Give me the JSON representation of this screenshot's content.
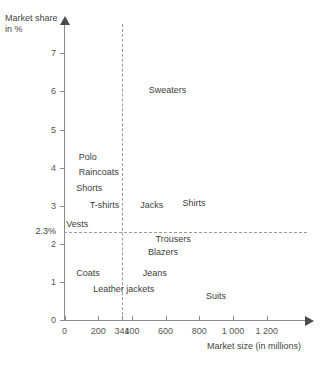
{
  "chart_data": {
    "type": "scatter",
    "title": "",
    "subtitle": "",
    "xlabel": "Market size (in millions)",
    "ylabel_line1": "Market share",
    "ylabel_line2": "in %",
    "xlim": [
      0,
      1280
    ],
    "ylim": [
      0,
      7.6
    ],
    "grid": false,
    "legend": "none",
    "x_ticks": [
      {
        "value": 0,
        "label": "0"
      },
      {
        "value": 200,
        "label": "200"
      },
      {
        "value": 341,
        "label": "341"
      },
      {
        "value": 400,
        "label": "400"
      },
      {
        "value": 600,
        "label": "600"
      },
      {
        "value": 800,
        "label": "800"
      },
      {
        "value": 1000,
        "label": "1 000"
      },
      {
        "value": 1200,
        "label": "1 200"
      }
    ],
    "y_ticks": [
      {
        "value": 0,
        "label": "0"
      },
      {
        "value": 1,
        "label": "1"
      },
      {
        "value": 2,
        "label": "2"
      },
      {
        "value": 3,
        "label": "3"
      },
      {
        "value": 4,
        "label": "4"
      },
      {
        "value": 5,
        "label": "5"
      },
      {
        "value": 6,
        "label": "6"
      },
      {
        "value": 7,
        "label": "7"
      }
    ],
    "reference_lines": [
      {
        "orientation": "horizontal",
        "value": 2.3,
        "label": "2.3%",
        "style": "dashed"
      },
      {
        "orientation": "vertical",
        "value": 341,
        "label": "341",
        "style": "dashed"
      }
    ],
    "points": [
      {
        "label": "Sweaters",
        "x": 500,
        "y": 6.0
      },
      {
        "label": "Polo",
        "x": 85,
        "y": 4.25
      },
      {
        "label": "Raincoats",
        "x": 85,
        "y": 3.85
      },
      {
        "label": "Shorts",
        "x": 70,
        "y": 3.45
      },
      {
        "label": "T-shirts",
        "x": 150,
        "y": 3.0
      },
      {
        "label": "Jacks",
        "x": 450,
        "y": 3.0
      },
      {
        "label": "Shirts",
        "x": 700,
        "y": 3.05
      },
      {
        "label": "Vests",
        "x": 10,
        "y": 2.5
      },
      {
        "label": "Trousers",
        "x": 540,
        "y": 2.1
      },
      {
        "label": "Blazers",
        "x": 495,
        "y": 1.75
      },
      {
        "label": "Coats",
        "x": 70,
        "y": 1.2
      },
      {
        "label": "Jeans",
        "x": 465,
        "y": 1.2
      },
      {
        "label": "Leather jackets",
        "x": 170,
        "y": 0.8
      },
      {
        "label": "Suits",
        "x": 840,
        "y": 0.6
      }
    ]
  }
}
